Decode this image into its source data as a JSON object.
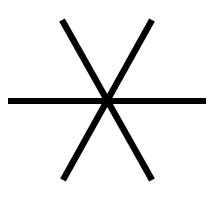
{
  "icon": {
    "name": "asterisk-icon",
    "stroke_color": "#000000",
    "background": "#ffffff",
    "stroke_width": 6
  }
}
